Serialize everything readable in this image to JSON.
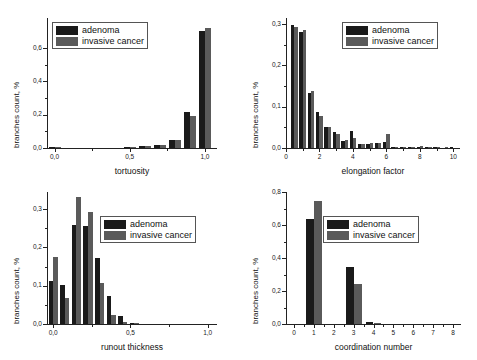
{
  "figure": {
    "background": "#ffffff",
    "series_colors": {
      "adenoma": "#1a1a1a",
      "invasive_cancer": "#5a5a5a"
    },
    "legend": {
      "adenoma_label": "adenoma",
      "invasive_label": "invasive cancer"
    }
  },
  "chart_data": [
    {
      "type": "bar",
      "panel": "top-left",
      "title": "",
      "xlabel": "tortuosity",
      "ylabel": "branches count, %",
      "xlim": [
        -0.05,
        1.08
      ],
      "ylim": [
        0.0,
        0.78
      ],
      "xticks": [
        0.0,
        0.5,
        1.0
      ],
      "xtick_labels": [
        "0,0",
        "0,5",
        "1,0"
      ],
      "yticks": [
        0.0,
        0.2,
        0.4,
        0.6
      ],
      "ytick_labels": [
        "0,0",
        "0,2",
        "0,4",
        "0,6"
      ],
      "grid": false,
      "legend_position": "top-left",
      "x": [
        0.0,
        0.1,
        0.2,
        0.3,
        0.4,
        0.5,
        0.6,
        0.7,
        0.8,
        0.9,
        1.0
      ],
      "series": [
        {
          "name": "adenoma",
          "values": [
            0.004,
            0.0,
            0.0,
            0.0,
            0.0,
            0.003,
            0.01,
            0.016,
            0.048,
            0.218,
            0.7
          ]
        },
        {
          "name": "invasive cancer",
          "values": [
            0.002,
            0.0,
            0.0,
            0.0,
            0.0,
            0.004,
            0.013,
            0.017,
            0.05,
            0.19,
            0.722
          ]
        }
      ]
    },
    {
      "type": "bar",
      "panel": "top-right",
      "title": "",
      "xlabel": "elongation factor",
      "ylabel": "branches count, %",
      "xlim": [
        0.0,
        10.4
      ],
      "ylim": [
        0.0,
        0.315
      ],
      "xticks": [
        0,
        2,
        4,
        6,
        8,
        10
      ],
      "xtick_labels": [
        "0",
        "2",
        "4",
        "6",
        "8",
        "10"
      ],
      "yticks": [
        0.0,
        0.1,
        0.2,
        0.3
      ],
      "ytick_labels": [
        "0,0",
        "0,1",
        "0,2",
        "0,3"
      ],
      "grid": false,
      "legend_position": "top-right",
      "x": [
        0.5,
        1.0,
        1.5,
        2.0,
        2.5,
        3.0,
        3.5,
        4.0,
        4.5,
        5.0,
        5.5,
        6.0,
        6.5,
        7.0,
        7.5,
        8.0,
        8.5,
        9.0,
        9.5,
        10.0
      ],
      "series": [
        {
          "name": "adenoma",
          "values": [
            0.299,
            0.281,
            0.134,
            0.088,
            0.05,
            0.038,
            0.018,
            0.041,
            0.009,
            0.01,
            0.011,
            0.014,
            0.003,
            0.002,
            0.002,
            0.003,
            0.001,
            0.001,
            0.0,
            0.001
          ]
        },
        {
          "name": "invasive cancer",
          "values": [
            0.292,
            0.286,
            0.137,
            0.077,
            0.05,
            0.034,
            0.019,
            0.025,
            0.01,
            0.012,
            0.013,
            0.033,
            0.003,
            0.002,
            0.003,
            0.004,
            0.002,
            0.001,
            0.001,
            0.0
          ]
        }
      ]
    },
    {
      "type": "bar",
      "panel": "bottom-left",
      "title": "",
      "xlabel": "runout thickness",
      "ylabel": "branches count, %",
      "xlim": [
        -0.04,
        1.06
      ],
      "ylim": [
        0.0,
        0.345
      ],
      "xticks": [
        0.0,
        0.5,
        1.0
      ],
      "xtick_labels": [
        "0,0",
        "0,5",
        "1,0"
      ],
      "yticks": [
        0.0,
        0.1,
        0.2,
        0.3
      ],
      "ytick_labels": [
        "0,0",
        "0,1",
        "0,2",
        "0,3"
      ],
      "grid": false,
      "legend_position": "top-right",
      "x": [
        0.0,
        0.075,
        0.15,
        0.225,
        0.3,
        0.375,
        0.45,
        0.525,
        0.6
      ],
      "series": [
        {
          "name": "adenoma",
          "values": [
            0.113,
            0.103,
            0.259,
            0.255,
            0.172,
            0.074,
            0.02,
            0.003,
            0.0
          ]
        },
        {
          "name": "invasive cancer",
          "values": [
            0.176,
            0.068,
            0.333,
            0.292,
            0.107,
            0.024,
            0.005,
            0.001,
            0.0
          ]
        }
      ]
    },
    {
      "type": "bar",
      "panel": "bottom-right",
      "title": "",
      "xlabel": "coordination number",
      "ylabel": "branches count, %",
      "xlim": [
        -0.4,
        8.4
      ],
      "ylim": [
        0.0,
        0.8
      ],
      "xticks": [
        0,
        1,
        2,
        3,
        4,
        5,
        6,
        7,
        8
      ],
      "xtick_labels": [
        "0",
        "1",
        "2",
        "3",
        "4",
        "5",
        "6",
        "7",
        "8"
      ],
      "yticks": [
        0.0,
        0.2,
        0.4,
        0.6,
        0.8
      ],
      "ytick_labels": [
        "0,0",
        "0,2",
        "0,4",
        "0,6",
        "0,8"
      ],
      "grid": false,
      "legend_position": "top-right",
      "x": [
        0,
        1,
        2,
        3,
        4,
        5,
        6,
        7,
        8
      ],
      "series": [
        {
          "name": "adenoma",
          "values": [
            0.0,
            0.635,
            0.0,
            0.345,
            0.011,
            0.0,
            0.0,
            0.0,
            0.0
          ]
        },
        {
          "name": "invasive cancer",
          "values": [
            0.0,
            0.745,
            0.0,
            0.245,
            0.007,
            0.0,
            0.0,
            0.0,
            0.0
          ]
        }
      ]
    }
  ]
}
